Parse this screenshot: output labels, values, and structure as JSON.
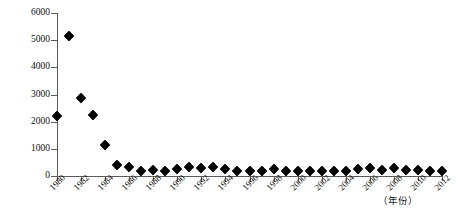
{
  "chart_data": {
    "type": "scatter",
    "title": "",
    "subtitle": "",
    "xlabel": "（年份）",
    "ylabel": "（万t/日）",
    "xlim": [
      1980,
      2012
    ],
    "ylim": [
      0,
      6000
    ],
    "grid": false,
    "legend": null,
    "ytick_labels": [
      "0",
      "1000",
      "2000",
      "3000",
      "4000",
      "5000",
      "6000"
    ],
    "ytick_values": [
      0,
      1000,
      2000,
      3000,
      4000,
      5000,
      6000
    ],
    "xtick_labels": [
      "1980",
      "1982",
      "1984",
      "1986",
      "1988",
      "1990",
      "1992",
      "1994",
      "1996",
      "1998",
      "2000",
      "2002",
      "2004",
      "2006",
      "2008",
      "2010",
      "2012"
    ],
    "xtick_values": [
      1980,
      1982,
      1984,
      1986,
      1988,
      1990,
      1992,
      1994,
      1996,
      1998,
      2000,
      2002,
      2004,
      2006,
      2008,
      2010,
      2012
    ],
    "marker": "diamond",
    "marker_color": "#000000",
    "x": [
      1980,
      1981,
      1982,
      1983,
      1984,
      1985,
      1986,
      1987,
      1988,
      1989,
      1990,
      1991,
      1992,
      1993,
      1994,
      1995,
      1996,
      1997,
      1998,
      1999,
      2000,
      2001,
      2002,
      2003,
      2004,
      2005,
      2006,
      2007,
      2008,
      2009,
      2010,
      2011,
      2012
    ],
    "values": [
      2200,
      5150,
      2870,
      2240,
      1130,
      420,
      330,
      180,
      210,
      200,
      260,
      320,
      290,
      330,
      240,
      180,
      200,
      170,
      240,
      190,
      180,
      200,
      170,
      200,
      190,
      250,
      300,
      230,
      290,
      230,
      220,
      200,
      170
    ],
    "series": [
      {
        "name": "",
        "points": [
          {
            "x": 1980,
            "y": 2200
          },
          {
            "x": 1981,
            "y": 5150
          },
          {
            "x": 1982,
            "y": 2870
          },
          {
            "x": 1983,
            "y": 2240
          },
          {
            "x": 1984,
            "y": 1130
          },
          {
            "x": 1985,
            "y": 420
          },
          {
            "x": 1986,
            "y": 330
          },
          {
            "x": 1987,
            "y": 180
          },
          {
            "x": 1988,
            "y": 210
          },
          {
            "x": 1989,
            "y": 200
          },
          {
            "x": 1990,
            "y": 260
          },
          {
            "x": 1991,
            "y": 320
          },
          {
            "x": 1992,
            "y": 290
          },
          {
            "x": 1993,
            "y": 330
          },
          {
            "x": 1994,
            "y": 240
          },
          {
            "x": 1995,
            "y": 180
          },
          {
            "x": 1996,
            "y": 200
          },
          {
            "x": 1997,
            "y": 170
          },
          {
            "x": 1998,
            "y": 240
          },
          {
            "x": 1999,
            "y": 190
          },
          {
            "x": 2000,
            "y": 180
          },
          {
            "x": 2001,
            "y": 200
          },
          {
            "x": 2002,
            "y": 170
          },
          {
            "x": 2003,
            "y": 200
          },
          {
            "x": 2004,
            "y": 190
          },
          {
            "x": 2005,
            "y": 250
          },
          {
            "x": 2006,
            "y": 300
          },
          {
            "x": 2007,
            "y": 230
          },
          {
            "x": 2008,
            "y": 290
          },
          {
            "x": 2009,
            "y": 230
          },
          {
            "x": 2010,
            "y": 220
          },
          {
            "x": 2011,
            "y": 200
          },
          {
            "x": 2012,
            "y": 170
          }
        ]
      }
    ]
  }
}
